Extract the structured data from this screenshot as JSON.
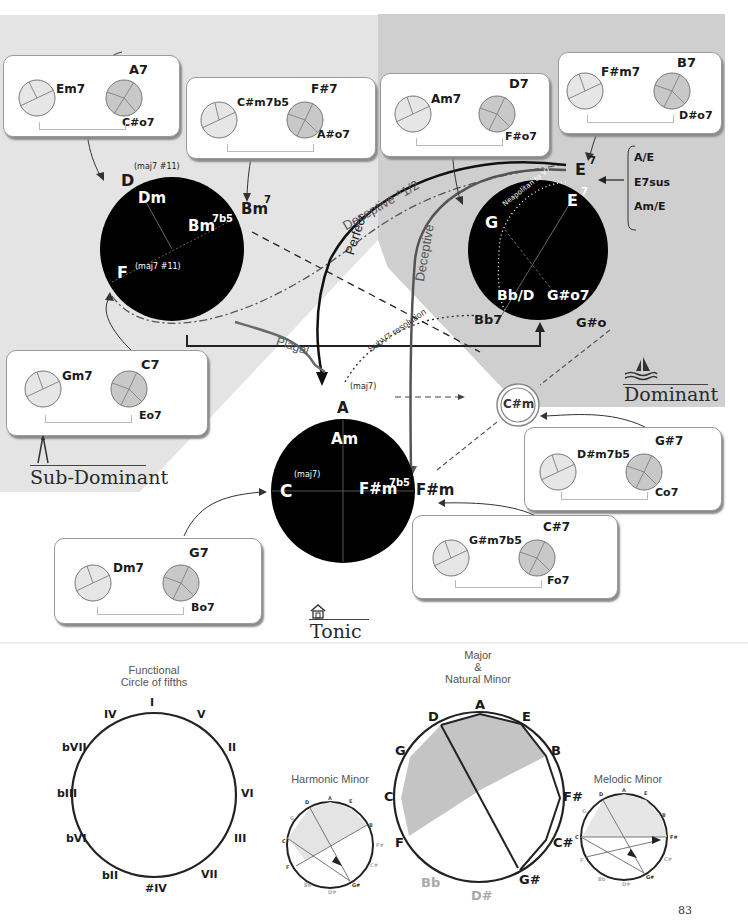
{
  "colors": {
    "subdominant_bg": "#e3e3e3",
    "dominant_bg": "#cdcdcd",
    "circle_fill": "#000000",
    "mini_light": "#e6e6e6",
    "mini_dark": "#c8c8c8",
    "shade": "#c4c4c4"
  },
  "regions": {
    "subdominant": {
      "title": "Sub-Dominant",
      "icon": "compass-icon"
    },
    "dominant": {
      "title": "Dominant",
      "icon": "sailboat-icon"
    },
    "tonic": {
      "title": "Tonic",
      "icon": "house-icon"
    }
  },
  "subdominant_circle": {
    "outer_top": "D",
    "outer_top_sup": "(maj7 #11)",
    "inner_top": "Dm",
    "inner_right": "Bm7b5",
    "inner_right_sup": "7b5",
    "inner_right_base": "Bm",
    "outer_right": "Bm",
    "outer_right_sup": "7",
    "inner_left": "F",
    "inner_left_sup": "(maj7 #11)"
  },
  "dominant_circle": {
    "outer_top": "E",
    "outer_top_sup": "7",
    "inner_top": "E",
    "inner_top_sup": "7",
    "inner_left": "G",
    "inner_bottom_left": "Bb/D",
    "inner_bottom_right": "G#o7",
    "outer_bottom_left": "Bb7",
    "outer_bottom_right": "G#o",
    "path_label": "Neapolitan to V7",
    "alternatives": [
      "A/E",
      "E7sus",
      "Am/E"
    ]
  },
  "tonic_circle": {
    "outer_top": "A",
    "outer_top_sup": "(maj7)",
    "inner_top": "Am",
    "inner_left": "C",
    "inner_left_sup": "(maj7)",
    "inner_right": "F#m",
    "inner_right_sup": "7b5",
    "outer_right": "F#m"
  },
  "relative_chord": "C#m",
  "cadences": {
    "perfect": "Perfect",
    "deceptive": "Deceptive",
    "deceptive_half": "Deceptive ^1/2",
    "plagal": "Plagal",
    "subv7": "SubV7 resolution"
  },
  "chord_boxes": [
    {
      "id": "box-a7",
      "minor": "Em7",
      "dominant": "A7",
      "dim": "C#o7",
      "target": "D"
    },
    {
      "id": "box-fs7",
      "minor": "C#m7b5",
      "dominant": "F#7",
      "dim": "A#o7",
      "target": "Bm7"
    },
    {
      "id": "box-d7",
      "minor": "Am7",
      "dominant": "D7",
      "dim": "F#o7",
      "target": "G"
    },
    {
      "id": "box-b7",
      "minor": "F#m7",
      "dominant": "B7",
      "dim": "D#o7",
      "target": "E7"
    },
    {
      "id": "box-c7",
      "minor": "Gm7",
      "dominant": "C7",
      "dim": "Eo7",
      "target": "F"
    },
    {
      "id": "box-g7",
      "minor": "Dm7",
      "dominant": "G7",
      "dim": "Bo7",
      "target": "C"
    },
    {
      "id": "box-gs7",
      "minor": "D#m7b5",
      "dominant": "G#7",
      "dim": "Co7",
      "target": "C#m"
    },
    {
      "id": "box-cs7",
      "minor": "G#m7b5",
      "dominant": "C#7",
      "dim": "Fo7",
      "target": "F#m"
    }
  ],
  "functional_circle": {
    "title_line1": "Functional",
    "title_line2": "Circle of fifths",
    "degrees": [
      "I",
      "V",
      "II",
      "VI",
      "III",
      "VII",
      "#IV",
      "bII",
      "bVI",
      "bIII",
      "bVII",
      "IV"
    ]
  },
  "major_circle": {
    "title_line1": "Major",
    "title_line2": "&",
    "title_line3": "Natural Minor",
    "notes": [
      "A",
      "E",
      "B",
      "F#",
      "C#",
      "G#",
      "D#",
      "Bb",
      "F",
      "C",
      "G",
      "D"
    ],
    "faded_notes": [
      "D#",
      "Bb"
    ]
  },
  "harmonic_minor": {
    "title": "Harmonic Minor",
    "notes": [
      "A",
      "E",
      "B",
      "F#",
      "C#",
      "G#",
      "D#",
      "Bb",
      "F",
      "C",
      "G",
      "D"
    ]
  },
  "melodic_minor": {
    "title": "Melodic Minor",
    "notes": [
      "A",
      "E",
      "B",
      "F#",
      "C#",
      "G#",
      "D#",
      "Bb",
      "F",
      "C",
      "G",
      "D"
    ]
  },
  "page_number": "83"
}
